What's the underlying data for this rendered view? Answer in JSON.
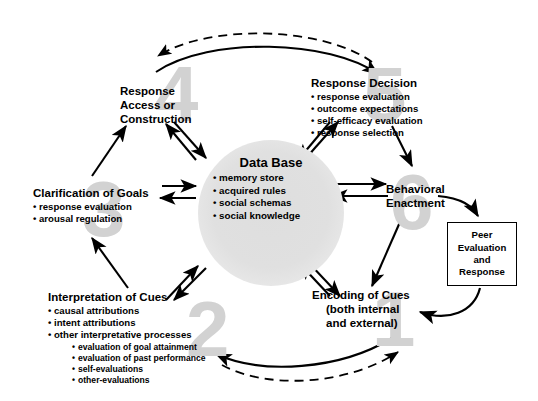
{
  "diagram": {
    "background_color": "#ffffff",
    "line_color": "#000000",
    "watermark_color": "#d2d2d2"
  },
  "database": {
    "title": "Data Base",
    "items": [
      "memory store",
      "acquired rules",
      "social schemas",
      "social knowledge"
    ]
  },
  "nodes": [
    {
      "number": "1",
      "title_line1": "Encoding of Cues",
      "title_line2": "(both internal",
      "title_line3": "and external)",
      "items": []
    },
    {
      "number": "2",
      "title": "Interpretation of Cues",
      "items": [
        "causal attributions",
        "intent attributions",
        "other interpretative processes"
      ],
      "subitems": [
        "evaluation of goal attainment",
        "evaluation of past performance",
        "self-evaluations",
        "other-evaluations"
      ]
    },
    {
      "number": "3",
      "title": "Clarification of Goals",
      "items": [
        "response evaluation",
        "arousal regulation"
      ]
    },
    {
      "number": "4",
      "title_line1": "Response",
      "title_line2": "Access or",
      "title_line3": "Construction",
      "items": []
    },
    {
      "number": "5",
      "title": "Response Decision",
      "items": [
        "response evaluation",
        "outcome expectations",
        "self-efficacy evaluation",
        "response selection"
      ]
    },
    {
      "number": "6",
      "title_line1": "Behavioral",
      "title_line2": "Enactment",
      "items": []
    }
  ],
  "peer_box": {
    "line1": "Peer",
    "line2": "Evaluation",
    "line3": "and",
    "line4": "Response"
  }
}
